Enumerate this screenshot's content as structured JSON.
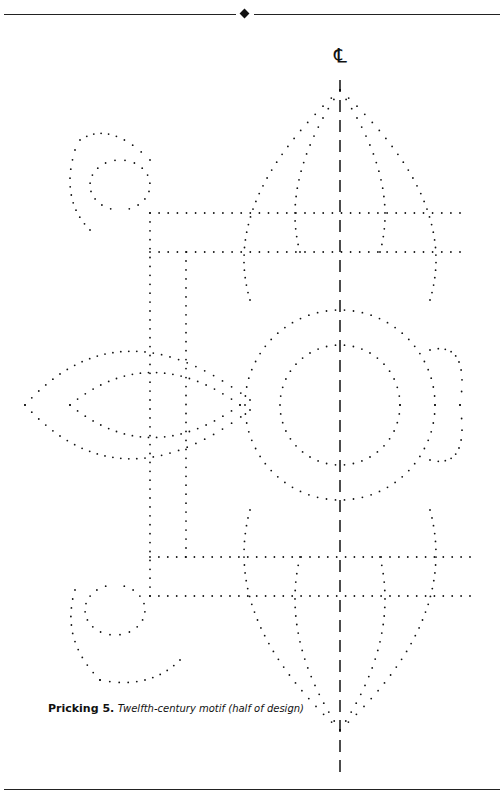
{
  "header": {
    "ornament": "diamond"
  },
  "centerline": {
    "symbol": "℄"
  },
  "caption": {
    "label": "Pricking 5.",
    "text": "Twelfth-century motif (half of design)"
  }
}
